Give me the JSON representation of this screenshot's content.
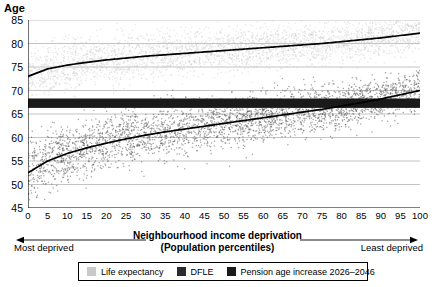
{
  "chart_data": {
    "type": "scatter",
    "title": "",
    "ylabel": "Age",
    "xlabel": "Neighbourhood income deprivation",
    "xlabel_line2": "(Population percentiles)",
    "xlim": [
      0,
      100
    ],
    "ylim": [
      45,
      85
    ],
    "grid": true,
    "legend_position": "bottom",
    "x_ticks": [
      0,
      5,
      10,
      15,
      20,
      25,
      30,
      35,
      40,
      45,
      50,
      55,
      60,
      65,
      70,
      75,
      80,
      85,
      90,
      95,
      100
    ],
    "y_ticks": [
      45,
      50,
      55,
      60,
      65,
      70,
      75,
      80,
      85
    ],
    "annotations": {
      "left_arrow_label": "Most deprived",
      "right_arrow_label": "Least deprived"
    },
    "series": [
      {
        "name": "Life expectancy",
        "type": "scatter+trend",
        "color": "#c9c9c9",
        "trend_color": "#000000",
        "point_count": 3200,
        "scatter_spread": 2.3,
        "x": [
          0,
          5,
          10,
          15,
          20,
          25,
          30,
          35,
          40,
          45,
          50,
          55,
          60,
          65,
          70,
          75,
          80,
          85,
          90,
          95,
          100
        ],
        "trend": [
          73.0,
          74.6,
          75.4,
          76.0,
          76.5,
          76.9,
          77.3,
          77.6,
          77.9,
          78.2,
          78.5,
          78.8,
          79.1,
          79.4,
          79.7,
          80.0,
          80.4,
          80.8,
          81.2,
          81.7,
          82.2
        ]
      },
      {
        "name": "DFLE",
        "type": "scatter+trend",
        "color": "#5a5a5a",
        "trend_color": "#000000",
        "point_count": 3200,
        "scatter_spread": 2.6,
        "x": [
          0,
          5,
          10,
          15,
          20,
          25,
          30,
          35,
          40,
          45,
          50,
          55,
          60,
          65,
          70,
          75,
          80,
          85,
          90,
          95,
          100
        ],
        "trend": [
          52.5,
          55.0,
          56.6,
          57.8,
          58.8,
          59.7,
          60.5,
          61.2,
          61.8,
          62.4,
          63.0,
          63.6,
          64.2,
          64.8,
          65.4,
          66.0,
          66.7,
          67.4,
          68.2,
          69.1,
          70.0
        ]
      },
      {
        "name": "Pension age increase 2026-2046",
        "type": "band",
        "color": "#1a1a1a",
        "band_low": 66.3,
        "band_high": 68.3
      }
    ]
  },
  "legend": {
    "items": [
      {
        "label": "Life expectancy",
        "color": "#c9c9c9"
      },
      {
        "label": "DFLE",
        "color": "#2b2b2b"
      },
      {
        "label": "Pension age increase 2026–2046",
        "color": "#1a1a1a"
      }
    ]
  },
  "axis": {
    "y_title": "Age",
    "x_title_line1": "Neighbourhood income deprivation",
    "x_title_line2": "(Population percentiles)",
    "most_deprived": "Most deprived",
    "least_deprived": "Least deprived"
  }
}
